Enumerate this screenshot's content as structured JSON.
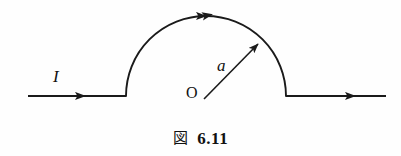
{
  "figure": {
    "background_color": "#fefefe",
    "stroke_color": "#1a1a1a",
    "labels": {
      "current": "I",
      "radius": "a",
      "origin": "O"
    },
    "caption": {
      "fig_word": "図",
      "number": "6.11",
      "full": "図 6.11"
    },
    "icons": {
      "current_arrow_left": "arrow-right-icon",
      "current_arrow_right": "arrow-right-icon",
      "arc_arrow": "arrow-right-icon",
      "radius_arrow": "arrow-up-right-icon"
    },
    "geometry": {
      "arc_center_x": 206,
      "arc_center_y": 96,
      "arc_radius": 80,
      "baseline_y": 96,
      "wire_left_start_x": 28,
      "wire_left_end_x": 126,
      "wire_right_start_x": 287,
      "wire_right_end_x": 386,
      "radius_vector_angle_deg": 45
    }
  }
}
